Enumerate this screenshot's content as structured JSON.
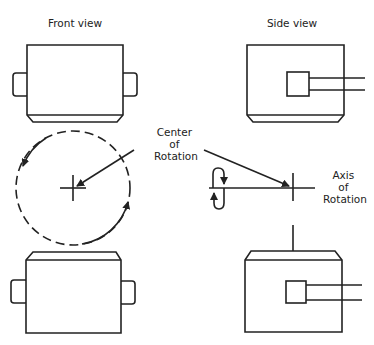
{
  "labels": {
    "front_view": "Front view",
    "side_view": "Side view",
    "center_of_rotation": [
      "Center",
      "of",
      "Rotation"
    ],
    "axis_of_rotation": [
      "Axis",
      "of",
      "Rotation"
    ]
  },
  "colors": {
    "stroke": "#222222",
    "background": "#ffffff"
  }
}
